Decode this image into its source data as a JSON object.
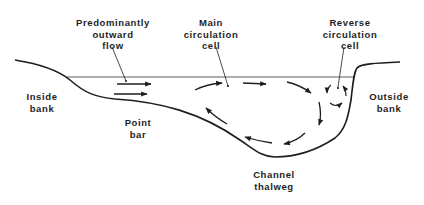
{
  "diagram": {
    "type": "cross-section",
    "colors": {
      "ink": "#1e1e1e",
      "background": "#ffffff"
    },
    "labels": {
      "outward_flow": [
        "Predominantly",
        "outward",
        "flow"
      ],
      "main_cell": [
        "Main",
        "circulation",
        "cell"
      ],
      "reverse_cell": [
        "Reverse",
        "circulation",
        "cell"
      ],
      "inside_bank": [
        "Inside",
        "bank"
      ],
      "outside_bank": [
        "Outside",
        "bank"
      ],
      "point_bar": [
        "Point",
        "bar"
      ],
      "thalweg": [
        "Channel",
        "thalweg"
      ]
    }
  }
}
